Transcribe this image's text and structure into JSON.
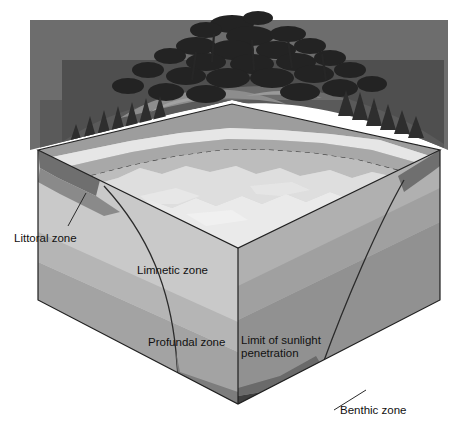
{
  "figure": {
    "type": "cutaway-block-diagram",
    "background": "#ffffff"
  },
  "labels": {
    "littoral": "Littoral zone",
    "limnetic": "Limnetic zone",
    "profundal": "Profundal zone",
    "sunlight_line1": "Limit of sunlight",
    "sunlight_line2": "penetration",
    "benthic": "Benthic zone"
  },
  "caption": {
    "text": ""
  },
  "palette": {
    "page_bg": "#ffffff",
    "face_left_top": "#c9c9c9",
    "face_left_bottom": "#9a9a9a",
    "face_right_top": "#b4b4b4",
    "face_right_bottom": "#8e8e8e",
    "water_surface_light": "#e2e2e2",
    "water_surface_mid": "#cfcfcf",
    "shore_band": "#9d9d9d",
    "shore_band_light": "#dcdcdc",
    "littoral_wedge": "#6f6f6f",
    "benthic_dark": "#3c3c3c",
    "terrain_dark": "#4a4a4a",
    "foliage_dark": "#2b2b2b",
    "foliage_mid": "#565656",
    "foliage_light": "#7d7d7d",
    "outline": "#1a1a1a",
    "leader": "#2a2a2a",
    "text": "#111111"
  },
  "zones": [
    {
      "name": "Littoral zone",
      "description": "shallow shelf near shore"
    },
    {
      "name": "Limnetic zone",
      "description": "open sunlit surface water"
    },
    {
      "name": "Profundal zone",
      "description": "deep water below light limit"
    },
    {
      "name": "Benthic zone",
      "description": "lake bottom sediment"
    }
  ],
  "annotations": {
    "sunlight_limit": "dashed line marking limit of sunlight penetration"
  }
}
